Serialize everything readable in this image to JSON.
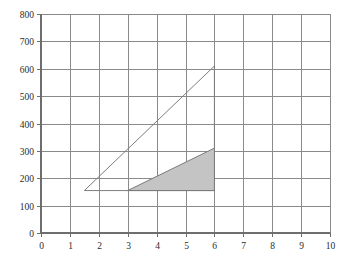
{
  "chart_data": {
    "type": "area",
    "title": "",
    "subtitle": "",
    "xlabel": "",
    "ylabel": "",
    "xlim": [
      0,
      10
    ],
    "ylim": [
      0,
      800
    ],
    "grid": true,
    "legend": "none",
    "x_ticks": [
      "0",
      "1",
      "2",
      "3",
      "4",
      "5",
      "6",
      "7",
      "8",
      "9",
      "10"
    ],
    "x_tick_values": [
      0,
      1,
      2,
      3,
      4,
      5,
      6,
      7,
      8,
      9,
      10
    ],
    "y_ticks": [
      "0",
      "100",
      "200",
      "300",
      "400",
      "500",
      "600",
      "700",
      "800"
    ],
    "y_tick_values": [
      0,
      100,
      200,
      300,
      400,
      500,
      600,
      700,
      800
    ],
    "series": [
      {
        "name": "outer-triangle",
        "fill": "none",
        "fill_color": "#ffffff",
        "stroke_color": "#7d7d7d",
        "points": [
          [
            1.5,
            155
          ],
          [
            6,
            610
          ],
          [
            6,
            155
          ]
        ]
      },
      {
        "name": "shaded-triangle",
        "fill": "solid",
        "fill_color": "#c4c4c4",
        "stroke_color": "#7a7a7a",
        "points": [
          [
            3,
            155
          ],
          [
            6,
            310
          ],
          [
            6,
            155
          ]
        ]
      }
    ],
    "annotations": []
  },
  "colors": {
    "background": "#ffffff",
    "gridline": "#8a8a8a",
    "axis": "#6e6e6e",
    "shaded_fill": "#c4c4c4",
    "outline_stroke": "#7d7d7d",
    "tick_text": "#2b2b2b"
  }
}
